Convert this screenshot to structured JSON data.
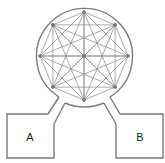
{
  "diagram": {
    "title": "",
    "network": {
      "node_count": 9,
      "node_ids": [
        "top",
        "upper-right",
        "right",
        "lower-right",
        "bottom",
        "lower-left",
        "left",
        "upper-left",
        "center"
      ],
      "fully_connected_ring": true,
      "center_connected_to_all": true
    },
    "chambers": [
      {
        "id": "A",
        "label": "A"
      },
      {
        "id": "B",
        "label": "B"
      }
    ],
    "colors": {
      "outline": "#7a7a7a",
      "edges": "#858585",
      "nodes": "#6e6e6e",
      "labels": "#1a1a1a"
    }
  }
}
